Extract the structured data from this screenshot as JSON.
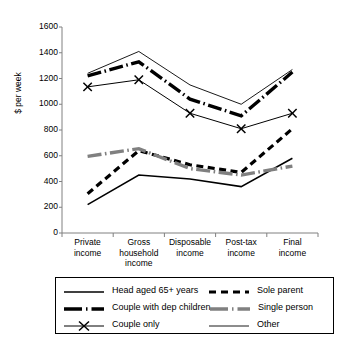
{
  "chart_data": {
    "type": "line",
    "title": "",
    "xlabel": "",
    "ylabel": "$ per week",
    "ylim": [
      0,
      1600
    ],
    "yticks": [
      0,
      200,
      400,
      600,
      800,
      1000,
      1200,
      1400,
      1600
    ],
    "grid": false,
    "legend_position": "bottom",
    "categories": [
      "Private\nincome",
      "Gross\nhousehold\nincome",
      "Disposable\nincome",
      "Post-tax\nincome",
      "Final\nincome"
    ],
    "series": [
      {
        "name": "Head aged 65+ years",
        "style": "solid-thin",
        "color": "#000000",
        "values": [
          220,
          450,
          420,
          360,
          580
        ]
      },
      {
        "name": "Couple with dep children",
        "style": "dash-dot-thick",
        "color": "#000000",
        "values": [
          1220,
          1330,
          1040,
          910,
          1250
        ]
      },
      {
        "name": "Couple only",
        "style": "solid-marker-x",
        "color": "#000000",
        "values": [
          1135,
          1190,
          930,
          810,
          930
        ]
      },
      {
        "name": "Sole parent",
        "style": "dashed-bold",
        "color": "#000000",
        "values": [
          305,
          640,
          530,
          470,
          810
        ]
      },
      {
        "name": "Single person",
        "style": "dash-dot-gray",
        "color": "#808080",
        "values": [
          595,
          655,
          500,
          450,
          520
        ]
      },
      {
        "name": "Other",
        "style": "solid-hairline",
        "color": "#000000",
        "values": [
          1240,
          1410,
          1150,
          1000,
          1270
        ]
      }
    ]
  },
  "axis": {
    "y_title": "$ per week",
    "y_tick_labels": [
      "1600",
      "1400",
      "1200",
      "1000",
      "800",
      "600",
      "400",
      "200",
      "0"
    ]
  },
  "legend": {
    "rows": [
      {
        "left": "Head aged 65+ years",
        "right": "Sole parent"
      },
      {
        "left": "Couple with dep children",
        "right": "Single person"
      },
      {
        "left": "Couple only",
        "right": "Other"
      }
    ]
  },
  "caption": {
    "text": ""
  }
}
